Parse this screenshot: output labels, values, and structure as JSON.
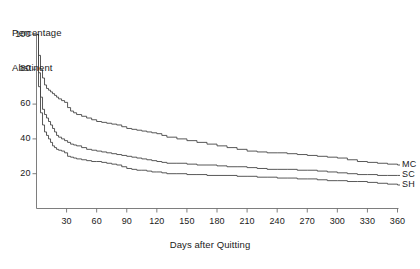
{
  "chart_data": {
    "type": "line",
    "title": "",
    "ylabel": "Percentage Abstinent",
    "ylabel_line1": "Percentage",
    "ylabel_line2": "Abstinent",
    "xlabel": "Days after Quitting",
    "xlim": [
      0,
      360
    ],
    "ylim": [
      0,
      100
    ],
    "xticks": [
      30,
      60,
      90,
      120,
      150,
      180,
      210,
      240,
      270,
      300,
      330,
      360
    ],
    "yticks": [
      20,
      40,
      60,
      80,
      100
    ],
    "grid": false,
    "legend_position": "right-inline",
    "line_color": "#454545",
    "axis_color": "#6f6f6f",
    "background": "#ffffff",
    "series": [
      {
        "name": "MC",
        "label": "MC",
        "x": [
          0,
          2,
          4,
          6,
          8,
          10,
          12,
          14,
          16,
          18,
          20,
          22,
          25,
          28,
          31,
          34,
          37,
          40,
          45,
          50,
          55,
          60,
          65,
          70,
          75,
          80,
          85,
          90,
          95,
          100,
          105,
          110,
          115,
          120,
          125,
          130,
          140,
          150,
          160,
          170,
          180,
          190,
          200,
          210,
          220,
          230,
          240,
          250,
          260,
          270,
          280,
          290,
          300,
          310,
          320,
          330,
          340,
          350,
          360
        ],
        "values": [
          100,
          88,
          80,
          75,
          71,
          69,
          68,
          67,
          66,
          65,
          64,
          63,
          62,
          61,
          58,
          56,
          55,
          54,
          53,
          52,
          51,
          50,
          49.5,
          49,
          48.5,
          48,
          47,
          46,
          45.5,
          45,
          44.5,
          44,
          43.5,
          43,
          42,
          41,
          40,
          39,
          38,
          37,
          36,
          35,
          34,
          33,
          32.5,
          32,
          32,
          31.5,
          31,
          30.5,
          30,
          29.5,
          29,
          28,
          27,
          26.5,
          26,
          25.5,
          25
        ]
      },
      {
        "name": "SC",
        "label": "SC",
        "x": [
          0,
          2,
          4,
          6,
          8,
          10,
          12,
          14,
          16,
          18,
          20,
          22,
          25,
          28,
          31,
          34,
          37,
          40,
          45,
          50,
          55,
          60,
          65,
          70,
          75,
          80,
          85,
          90,
          95,
          100,
          105,
          110,
          115,
          120,
          125,
          130,
          140,
          150,
          160,
          170,
          180,
          190,
          200,
          210,
          220,
          230,
          240,
          250,
          260,
          270,
          280,
          290,
          300,
          310,
          320,
          330,
          340,
          350,
          360
        ],
        "values": [
          100,
          78,
          64,
          57,
          54,
          52,
          50,
          48,
          46,
          44,
          42,
          41,
          40,
          39,
          38,
          37,
          36.5,
          36,
          35,
          34,
          33.5,
          33,
          32.5,
          32,
          31.5,
          31,
          30.5,
          30,
          29.5,
          29,
          28.5,
          28,
          27.5,
          27,
          26.5,
          26,
          26,
          25.5,
          25,
          25,
          24.5,
          24,
          24,
          23.5,
          23,
          22.5,
          22.5,
          22.5,
          22,
          22,
          21.5,
          21,
          20.5,
          20,
          19.5,
          19.5,
          19,
          19,
          19
        ]
      },
      {
        "name": "SH",
        "label": "SH",
        "x": [
          0,
          2,
          4,
          6,
          8,
          10,
          12,
          14,
          16,
          18,
          20,
          22,
          25,
          28,
          31,
          34,
          37,
          40,
          45,
          50,
          55,
          60,
          65,
          70,
          75,
          80,
          85,
          90,
          95,
          100,
          105,
          110,
          115,
          120,
          125,
          130,
          140,
          150,
          160,
          170,
          180,
          190,
          200,
          210,
          220,
          230,
          240,
          250,
          260,
          270,
          280,
          290,
          300,
          310,
          320,
          330,
          340,
          350,
          360
        ],
        "values": [
          100,
          70,
          55,
          48,
          44,
          42,
          40,
          38,
          36,
          35,
          34,
          33.5,
          33,
          32,
          30,
          29.5,
          29,
          28.5,
          28,
          27.5,
          27,
          27,
          26.5,
          26,
          25.5,
          25,
          24,
          23,
          22.5,
          22,
          22,
          21.5,
          21,
          21,
          20.5,
          20,
          20,
          19.5,
          19.5,
          19,
          19,
          19,
          18.5,
          18.5,
          18,
          18,
          17.5,
          17.5,
          17,
          17,
          16.5,
          16,
          16,
          15.5,
          15.5,
          15,
          14.5,
          14,
          13.5
        ]
      }
    ]
  }
}
